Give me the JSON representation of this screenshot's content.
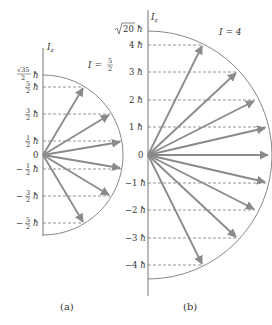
{
  "colors": {
    "arrow": "#8a8a8a",
    "axis": "#8a8a8a",
    "arc": "#7a7a7a",
    "dash": "#7a7a7a",
    "text": "#333333"
  },
  "diagrams": [
    {
      "id": "a",
      "caption": "(a)",
      "axis_label": "I",
      "axis_subscript": "z",
      "spin_label": "I = 5/2",
      "spin_label_prefix": "I =",
      "spin_num": "5",
      "spin_den": "2",
      "max_label": "√35/2 ħ",
      "max_label_num": "√35",
      "max_label_den": "2",
      "hbar": "ħ",
      "zero_label": "0",
      "levels": [
        {
          "m": "5/2",
          "num": "5",
          "den": "2",
          "sign": ""
        },
        {
          "m": "3/2",
          "num": "3",
          "den": "2",
          "sign": ""
        },
        {
          "m": "1/2",
          "num": "1",
          "den": "2",
          "sign": ""
        },
        {
          "m": "-1/2",
          "num": "1",
          "den": "2",
          "sign": "−"
        },
        {
          "m": "-3/2",
          "num": "3",
          "den": "2",
          "sign": "−"
        },
        {
          "m": "-5/2",
          "num": "5",
          "den": "2",
          "sign": "−"
        }
      ]
    },
    {
      "id": "b",
      "caption": "(b)",
      "axis_label": "I",
      "axis_subscript": "z",
      "spin_label": "I = 4",
      "max_label": "√20 ħ",
      "max_label_root": "20",
      "hbar": "ħ",
      "zero_label": "0",
      "levels": [
        {
          "m": "4",
          "label": "4"
        },
        {
          "m": "3",
          "label": "3"
        },
        {
          "m": "2",
          "label": "2"
        },
        {
          "m": "1",
          "label": "1"
        },
        {
          "m": "0",
          "label": "0"
        },
        {
          "m": "-1",
          "label": "−1"
        },
        {
          "m": "-2",
          "label": "−2"
        },
        {
          "m": "-3",
          "label": "−3"
        },
        {
          "m": "-4",
          "label": "−4"
        }
      ]
    }
  ]
}
